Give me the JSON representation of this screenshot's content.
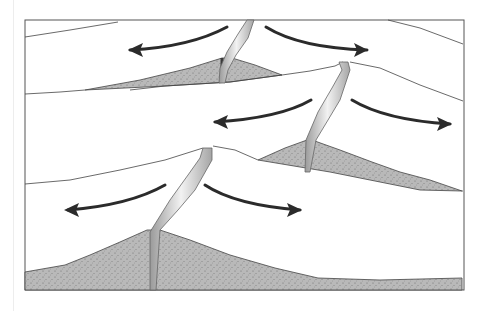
{
  "diagram": {
    "title": "",
    "frame": {
      "x": 25,
      "y": 20,
      "width": 439,
      "height": 270,
      "stroke": "#555555"
    },
    "colors": {
      "sediment": "#b9b9b9",
      "sediment_dots": "#6e6e6e",
      "line": "#444444",
      "arrow": "#2b2b2b",
      "vent_light": "#f2f2f2",
      "vent_dark": "#9a9a9a",
      "background": "#ffffff"
    },
    "sediments": [
      {
        "name": "top-ridge-sediment",
        "points": "85,90 140,80 190,68 222,58 232,58 255,65 282,75 230,82 165,86 85,90"
      },
      {
        "name": "middle-ridge-sediment",
        "points": "258,160 285,148 307,140 312,140 340,150 372,162 400,172 430,180 462,191 420,190 380,182 330,172 258,160"
      },
      {
        "name": "bottom-ridge-sediment",
        "points": "25,272 65,265 90,255 120,242 147,230 160,230 190,240 230,255 275,268 318,278 380,280 462,278 462,290 25,290"
      }
    ],
    "surface_lines": [
      {
        "name": "top-left-surface",
        "points": "25,37 70,30 118,22"
      },
      {
        "name": "top-right-surface",
        "points": "388,20 420,28 463,44"
      },
      {
        "name": "row1-bottom-line",
        "points": "25,94 60,92 85,90"
      },
      {
        "name": "middle-left-surface",
        "points": "282,75 310,71 335,66 343,62"
      },
      {
        "name": "middle-right-surface",
        "points": "350,62 380,68 420,85 463,101"
      },
      {
        "name": "row2-bottom-line",
        "points": "462,191 463,191"
      },
      {
        "name": "bottom-left-surface",
        "points": "25,184 70,180 120,170 165,160 203,148"
      },
      {
        "name": "bottom-right-surface",
        "points": "213,146 235,150 258,160"
      },
      {
        "name": "sediment-lower-edge",
        "points": "130,90 165,86 230,82 282,75"
      }
    ],
    "vents": [
      {
        "name": "top-ridge-vent",
        "points": "247,20 254,20 248,38 236,55 228,70 225,83 219,83 220,68 227,52 238,34"
      },
      {
        "name": "middle-ridge-vent",
        "points": "339,62 348,62 350,70 340,100 328,120 316,140 310,172 305,172 306,140 318,112 332,88 342,70"
      },
      {
        "name": "bottom-ridge-vent",
        "points": "203,148 212,148 212,160 195,190 178,210 160,230 156,290 150,290 150,232 170,200 188,175 200,158"
      }
    ],
    "feeder_dykes": [
      {
        "name": "top-ridge-dyke",
        "x1": 222,
        "y1": 58,
        "x2": 222,
        "y2": 83
      },
      {
        "name": "middle-ridge-dyke",
        "x1": 308,
        "y1": 140,
        "x2": 308,
        "y2": 172
      },
      {
        "name": "bottom-ridge-dyke",
        "x1": 153,
        "y1": 230,
        "x2": 153,
        "y2": 290
      }
    ],
    "arrows": [
      {
        "name": "top-left-arrow",
        "path": "M 227 27 Q 190 47 130 50",
        "head": "128,50 143,43 140,50 143,57"
      },
      {
        "name": "top-right-arrow",
        "path": "M 266 27 Q 300 48 367 50",
        "head": "368,50 354,43 357,50 354,57"
      },
      {
        "name": "middle-left-arrow",
        "path": "M 311 100 Q 280 118 215 122",
        "head": "213,122 228,115 225,122 228,129"
      },
      {
        "name": "middle-right-arrow",
        "path": "M 352 100 Q 385 120 450 124",
        "head": "452,124 437,117 440,124 437,131"
      },
      {
        "name": "bottom-left-arrow",
        "path": "M 165 185 Q 130 205 68 210",
        "head": "64,210 79,203 76,210 79,217"
      },
      {
        "name": "bottom-right-arrow",
        "path": "M 205 185 Q 235 205 300 210",
        "head": "302,210 287,203 290,210 287,217"
      }
    ]
  }
}
